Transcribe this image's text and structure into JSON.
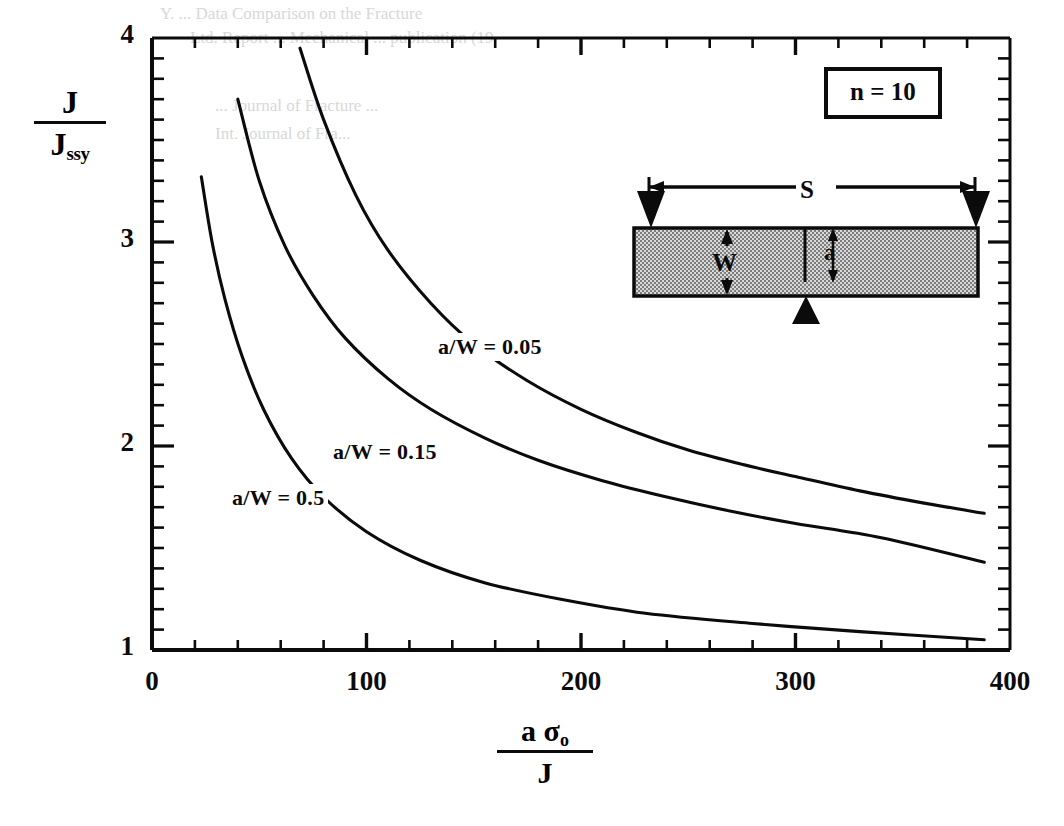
{
  "figure": {
    "n_label": "n = 10",
    "y_axis_label": {
      "numerator": "J",
      "denominator": "J",
      "denominator_sub": "ssy"
    },
    "x_axis_label": {
      "numerator": "a σ",
      "numerator_sub": "o",
      "denominator": "J"
    },
    "inset": {
      "name": "three-point-bend-specimen",
      "span_label": "S",
      "width_label": "W",
      "crack_label": "a",
      "fill_color": "#b4b4b4",
      "outline_color": "#0b0b0b"
    },
    "line_color": "#0b0b0b",
    "frame_color": "#0b0b0b"
  },
  "chart_data": {
    "type": "line",
    "title": "",
    "xlabel": "a σo / J",
    "ylabel": "J / Jssy",
    "xlim": [
      0,
      400
    ],
    "ylim": [
      1,
      4
    ],
    "grid": false,
    "legend": "inline-curve-labels",
    "xticks": [
      0,
      100,
      200,
      300,
      400
    ],
    "xticklabels": [
      "0",
      "100",
      "200",
      "300",
      "400"
    ],
    "xminor_step": 20,
    "yticks": [
      1,
      2,
      3,
      4
    ],
    "yticklabels": [
      "1",
      "2",
      "3",
      "4"
    ],
    "yminor_step": 0.1,
    "annotations": [
      {
        "text": "n = 10",
        "kind": "boxed-label",
        "x": 330,
        "y": 3.82
      },
      {
        "text": "a/W = 0.05",
        "kind": "curve-label",
        "x": 150,
        "y": 2.52
      },
      {
        "text": "a/W = 0.15",
        "kind": "curve-label",
        "x": 100,
        "y": 2.02
      },
      {
        "text": "a/W = 0.5",
        "kind": "curve-label",
        "x": 55,
        "y": 1.8
      }
    ],
    "series": [
      {
        "name": "a/W = 0.05",
        "label": "a/W = 0.05",
        "x": [
          69,
          80,
          95,
          110,
          130,
          150,
          175,
          200,
          225,
          250,
          275,
          300,
          330,
          360,
          388
        ],
        "values": [
          3.95,
          3.6,
          3.23,
          2.96,
          2.7,
          2.5,
          2.32,
          2.18,
          2.07,
          1.98,
          1.91,
          1.85,
          1.78,
          1.72,
          1.67
        ]
      },
      {
        "name": "a/W = 0.15",
        "label": "a/W = 0.15",
        "x": [
          40,
          50,
          62,
          75,
          90,
          110,
          130,
          155,
          180,
          210,
          240,
          270,
          300,
          340,
          388
        ],
        "values": [
          3.7,
          3.3,
          2.98,
          2.74,
          2.53,
          2.33,
          2.18,
          2.04,
          1.93,
          1.83,
          1.75,
          1.68,
          1.62,
          1.55,
          1.43
        ]
      },
      {
        "name": "a/W = 0.5",
        "label": "a/W = 0.5",
        "x": [
          23,
          28,
          34,
          42,
          52,
          65,
          80,
          100,
          125,
          155,
          190,
          230,
          280,
          330,
          388
        ],
        "values": [
          3.32,
          3.0,
          2.72,
          2.44,
          2.18,
          1.94,
          1.75,
          1.58,
          1.44,
          1.33,
          1.25,
          1.18,
          1.13,
          1.09,
          1.05
        ]
      }
    ]
  },
  "bleed_text": {
    "l1": "Y. ... Data Comparison on the Fracture",
    "l2": "Ltd. Report ... Mechanical ... publication (19",
    "l3": "... Journal of Fracture ... ",
    "l4": "Int. Journal of Fra..."
  }
}
